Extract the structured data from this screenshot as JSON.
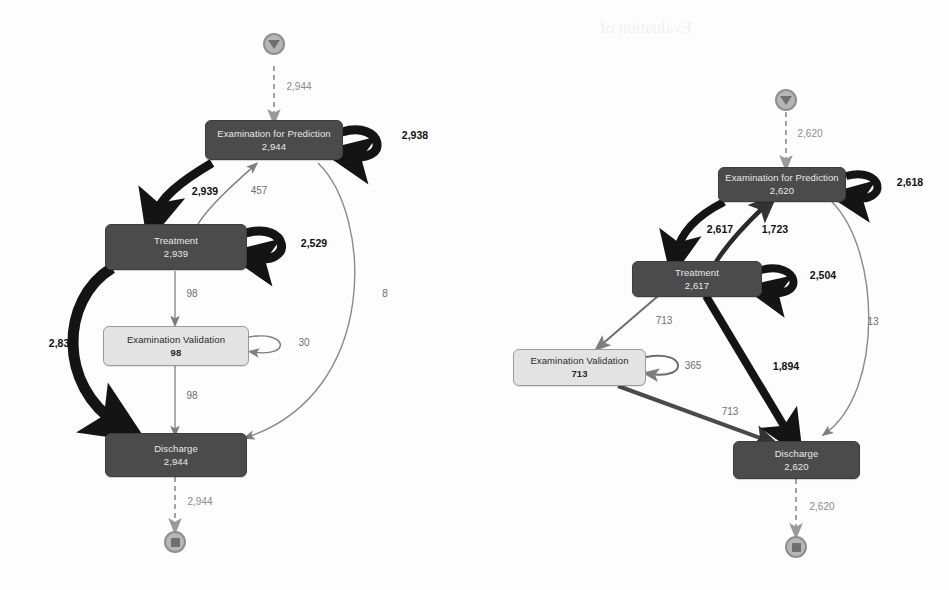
{
  "page": {
    "background_color": "#fdfdfd",
    "width": 949,
    "height": 590
  },
  "palette": {
    "node_dark_fill": "#4b4b4b",
    "node_dark_text": "#e9e9e9",
    "node_light_fill": "#e3e3e3",
    "node_light_text": "#2a2a2a",
    "endpoint_fill": "#b6b6b6",
    "endpoint_stroke": "#8e8e8e",
    "edge_dark": "#1a1a1a",
    "edge_mid": "#555555",
    "edge_light": "#9a9a9a",
    "edge_dashed": "#9a9a9a",
    "label_bold": "#111111",
    "label_muted": "#6e6e6e"
  },
  "diagrams": [
    {
      "id": "left-diagram",
      "name": "left-process-model",
      "start_marker": {
        "icon": "play-triangle-icon",
        "label": "start-node"
      },
      "end_marker": {
        "icon": "stop-square-icon",
        "label": "end-node"
      },
      "nodes": [
        {
          "id": "exam_pred",
          "label": "Examination for Prediction",
          "count": "2,944",
          "style": "dark"
        },
        {
          "id": "treatment",
          "label": "Treatment",
          "count": "2,939",
          "style": "dark"
        },
        {
          "id": "exam_valid",
          "label": "Examination Validation",
          "count": "98",
          "style": "light"
        },
        {
          "id": "discharge",
          "label": "Discharge",
          "count": "2,944",
          "style": "dark"
        }
      ],
      "edges": [
        {
          "id": "l-start-exam",
          "from": "start",
          "to": "exam_pred",
          "label": "2,944",
          "weight": "dashed",
          "emphasis": "faint"
        },
        {
          "id": "l-exam-self",
          "from": "exam_pred",
          "to": "exam_pred",
          "label": "2,938",
          "weight": "heavy",
          "emphasis": "bold"
        },
        {
          "id": "l-exam-treatment",
          "from": "exam_pred",
          "to": "treatment",
          "label": "2,939",
          "weight": "heavy",
          "emphasis": "bold"
        },
        {
          "id": "l-treatment-exam",
          "from": "treatment",
          "to": "exam_pred",
          "label": "457",
          "weight": "thin",
          "emphasis": "muted"
        },
        {
          "id": "l-treatment-self",
          "from": "treatment",
          "to": "treatment",
          "label": "2,529",
          "weight": "heavy",
          "emphasis": "bold"
        },
        {
          "id": "l-treatment-valid",
          "from": "treatment",
          "to": "exam_valid",
          "label": "98",
          "weight": "thin",
          "emphasis": "muted"
        },
        {
          "id": "l-valid-self",
          "from": "exam_valid",
          "to": "exam_valid",
          "label": "30",
          "weight": "thin",
          "emphasis": "muted"
        },
        {
          "id": "l-valid-discharge",
          "from": "exam_valid",
          "to": "discharge",
          "label": "98",
          "weight": "thin",
          "emphasis": "muted"
        },
        {
          "id": "l-treatment-disch",
          "from": "treatment",
          "to": "discharge",
          "label": "2,838",
          "weight": "heavy",
          "emphasis": "bold"
        },
        {
          "id": "l-exam-discharge",
          "from": "exam_pred",
          "to": "discharge",
          "label": "8",
          "weight": "thin",
          "emphasis": "muted"
        },
        {
          "id": "l-discharge-end",
          "from": "discharge",
          "to": "end",
          "label": "2,944",
          "weight": "dashed",
          "emphasis": "faint"
        }
      ]
    },
    {
      "id": "right-diagram",
      "name": "right-process-model",
      "start_marker": {
        "icon": "play-triangle-icon",
        "label": "start-node"
      },
      "end_marker": {
        "icon": "stop-square-icon",
        "label": "end-node"
      },
      "nodes": [
        {
          "id": "exam_pred",
          "label": "Examination for Prediction",
          "count": "2,620",
          "style": "dark"
        },
        {
          "id": "treatment",
          "label": "Treatment",
          "count": "2,617",
          "style": "dark"
        },
        {
          "id": "exam_valid",
          "label": "Examination Validation",
          "count": "713",
          "style": "light"
        },
        {
          "id": "discharge",
          "label": "Discharge",
          "count": "2,620",
          "style": "dark"
        }
      ],
      "edges": [
        {
          "id": "r-start-exam",
          "from": "start",
          "to": "exam_pred",
          "label": "2,620",
          "weight": "dashed",
          "emphasis": "faint"
        },
        {
          "id": "r-exam-self",
          "from": "exam_pred",
          "to": "exam_pred",
          "label": "2,618",
          "weight": "heavy",
          "emphasis": "bold"
        },
        {
          "id": "r-exam-treatment",
          "from": "exam_pred",
          "to": "treatment",
          "label": "2,617",
          "weight": "heavy",
          "emphasis": "bold"
        },
        {
          "id": "r-treatment-exam",
          "from": "treatment",
          "to": "exam_pred",
          "label": "1,723",
          "weight": "medium",
          "emphasis": "bold"
        },
        {
          "id": "r-treatment-self",
          "from": "treatment",
          "to": "treatment",
          "label": "2,504",
          "weight": "heavy",
          "emphasis": "bold"
        },
        {
          "id": "r-treatment-valid",
          "from": "treatment",
          "to": "exam_valid",
          "label": "713",
          "weight": "thin",
          "emphasis": "muted"
        },
        {
          "id": "r-valid-self",
          "from": "exam_valid",
          "to": "exam_valid",
          "label": "365",
          "weight": "thin",
          "emphasis": "muted"
        },
        {
          "id": "r-valid-discharge",
          "from": "exam_valid",
          "to": "discharge",
          "label": "713",
          "weight": "medium",
          "emphasis": "muted"
        },
        {
          "id": "r-treatment-disch",
          "from": "treatment",
          "to": "discharge",
          "label": "1,894",
          "weight": "heavy",
          "emphasis": "bold"
        },
        {
          "id": "r-exam-discharge",
          "from": "exam_pred",
          "to": "discharge",
          "label": "13",
          "weight": "thin",
          "emphasis": "muted"
        },
        {
          "id": "r-discharge-end",
          "from": "discharge",
          "to": "end",
          "label": "2,620",
          "weight": "dashed",
          "emphasis": "faint"
        }
      ]
    }
  ],
  "ghost_text": {
    "caption_fragment": "Evaluation of"
  }
}
